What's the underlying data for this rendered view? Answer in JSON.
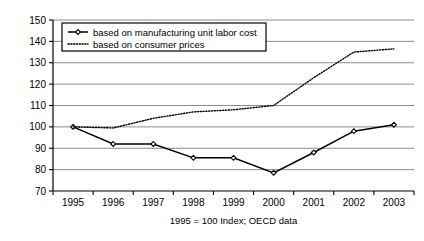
{
  "chart_data": {
    "type": "line",
    "title": "",
    "subtitle": "",
    "caption": "1995 = 100 Index; OECD data",
    "xlabel": "",
    "ylabel": "",
    "categories": [
      "1995",
      "1996",
      "1997",
      "1998",
      "1999",
      "2000",
      "2001",
      "2002",
      "2003"
    ],
    "x": [
      1995,
      1996,
      1997,
      1998,
      1999,
      2000,
      2001,
      2002,
      2003
    ],
    "ylim": [
      70,
      150
    ],
    "yticks": [
      70,
      80,
      90,
      100,
      110,
      120,
      130,
      140,
      150
    ],
    "grid": true,
    "legend_position": "top-left",
    "series": [
      {
        "name": "based on manufacturing unit labor cost",
        "style": "solid",
        "marker": "open-diamond",
        "color": "#000000",
        "values": [
          100,
          92,
          92,
          85.5,
          85.5,
          78.5,
          88,
          98,
          101
        ]
      },
      {
        "name": "based on consumer prices",
        "style": "dotted",
        "marker": "none",
        "color": "#000000",
        "values": [
          100,
          99.5,
          104,
          107,
          108,
          110,
          123,
          135,
          136.5
        ]
      }
    ]
  },
  "legend": {
    "entries": [
      {
        "label": "based on manufacturing unit labor cost"
      },
      {
        "label": "based on consumer prices"
      }
    ]
  },
  "axes": {
    "y_ticks": [
      "150",
      "140",
      "130",
      "120",
      "110",
      "100",
      "90",
      "80",
      "70"
    ],
    "x_ticks": [
      "1995",
      "1996",
      "1997",
      "1998",
      "1999",
      "2000",
      "2001",
      "2002",
      "2003"
    ]
  },
  "caption": {
    "text": "1995 = 100 Index; OECD data"
  },
  "colors": {
    "grid": "#6e6e6e",
    "axis": "#000000",
    "series": "#000000",
    "background": "#ffffff"
  }
}
